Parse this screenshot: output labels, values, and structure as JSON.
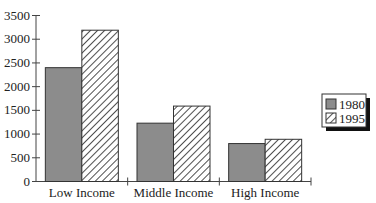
{
  "chart_data": {
    "type": "bar",
    "title": "",
    "xlabel": "",
    "ylabel": "",
    "categories": [
      "Low Income",
      "Middle Income",
      "High Income"
    ],
    "series": [
      {
        "name": "1980",
        "values": [
          2400,
          1230,
          800
        ],
        "fill": "#8c8c8c",
        "pattern": "solid"
      },
      {
        "name": "1995",
        "values": [
          3190,
          1590,
          890
        ],
        "fill": "#ffffff",
        "pattern": "diagonal-hatch"
      }
    ],
    "ylim": [
      0,
      3500
    ],
    "yticks": [
      0,
      500,
      1000,
      1500,
      2000,
      2500,
      3000,
      3500
    ],
    "grid": false,
    "legend_position": "right"
  },
  "legend": {
    "items": [
      {
        "label": "1980"
      },
      {
        "label": "1995"
      }
    ]
  }
}
